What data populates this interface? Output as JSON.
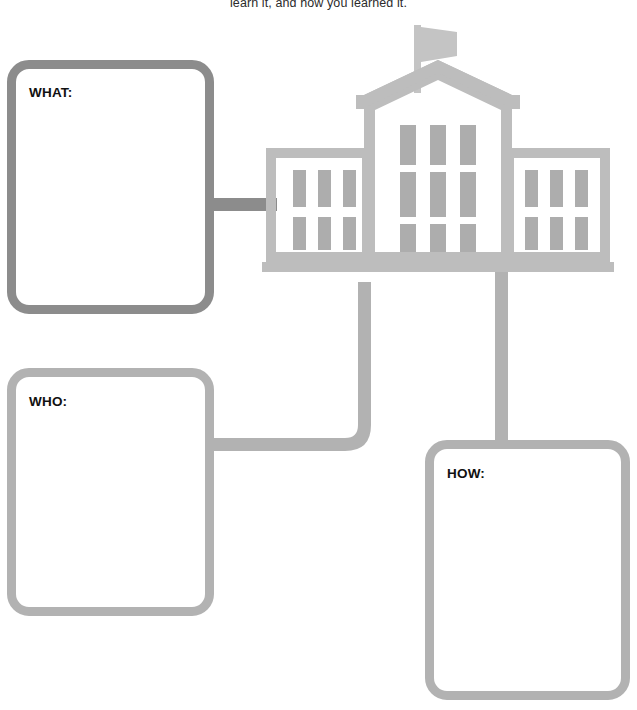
{
  "page": {
    "instruction_text": "learn it, and how you learned it.",
    "background_color": "#ffffff"
  },
  "boxes": [
    {
      "id": "what",
      "label": "WHAT:",
      "value": "",
      "border_color": "#8c8c8c"
    },
    {
      "id": "who",
      "label": "WHO:",
      "value": "",
      "border_color": "#b2b2b2"
    },
    {
      "id": "how",
      "label": "HOW:",
      "value": "",
      "border_color": "#b2b2b2"
    }
  ],
  "graphic": {
    "name": "government-building-icon",
    "body_color": "#bdbdbd",
    "window_color": "#adadad",
    "flag_color": "#c4c4c4"
  },
  "connectors": {
    "what_to_building_color": "#8c8c8c",
    "who_to_building_color": "#b2b2b2",
    "building_to_how_color": "#b2b2b2"
  }
}
